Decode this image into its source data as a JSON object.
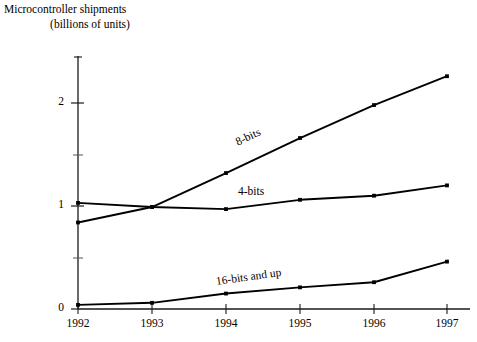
{
  "chart_data": {
    "type": "line",
    "title": "Microcontroller shipments (billions of units)",
    "title_line_1": "Microcontroller shipments",
    "title_line_2": "(billions of units)",
    "xlabel": "",
    "ylabel": "",
    "x": [
      "1992",
      "1993",
      "1994",
      "1995",
      "1996",
      "1997"
    ],
    "categories": [
      "1992",
      "1993",
      "1994",
      "1995",
      "1996",
      "1997"
    ],
    "ylim": [
      0,
      2.45
    ],
    "xlim": [
      "1992",
      "1997"
    ],
    "y_tick_labels": [
      "0",
      "1",
      "2"
    ],
    "y_tick_values": [
      0,
      1,
      2
    ],
    "y_minor_tick_values": [
      0.5,
      1.5
    ],
    "grid": false,
    "legend_position": "inline-labels",
    "series": [
      {
        "name": "8-bits",
        "label": "8-bits",
        "color": "#000000",
        "values": [
          0.84,
          0.99,
          1.32,
          1.66,
          1.98,
          2.26
        ]
      },
      {
        "name": "4-bits",
        "label": "4-bits",
        "color": "#000000",
        "values": [
          1.03,
          0.99,
          0.97,
          1.06,
          1.1,
          1.2
        ]
      },
      {
        "name": "16-bits and up",
        "label": "16-bits and up",
        "color": "#000000",
        "values": [
          0.04,
          0.06,
          0.15,
          0.21,
          0.26,
          0.46
        ]
      }
    ],
    "annotations": [
      {
        "text": "8-bits",
        "series": "8-bits",
        "rotation": -25
      },
      {
        "text": "4-bits",
        "series": "4-bits",
        "rotation": 0
      },
      {
        "text": "16-bits and up",
        "series": "16-bits and up",
        "rotation": -8
      }
    ]
  }
}
